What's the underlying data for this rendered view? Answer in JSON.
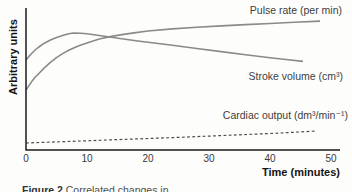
{
  "figure": {
    "caption_label": "Figure 2",
    "caption_text": "Correlated changes in …"
  },
  "chart_data": {
    "type": "line",
    "title": "",
    "xlabel": "Time (minutes)",
    "ylabel": "Arbitrary units",
    "xlim": [
      0,
      51.5
    ],
    "ylim": [
      0,
      100
    ],
    "x_ticks": [
      0,
      10,
      20,
      30,
      40,
      50
    ],
    "grid": false,
    "legend_position": "inline-labels-right",
    "axis_color": "#1a1a1a",
    "series": [
      {
        "id": "pulse-rate",
        "name": "Pulse rate (per min)",
        "style": "solid",
        "color": "#8a8a8a",
        "stroke_width": 1.6,
        "points": [
          [
            0,
            42.3
          ],
          [
            0.5,
            45.5
          ],
          [
            1,
            48.5
          ],
          [
            1.5,
            51.2
          ],
          [
            2,
            53.4
          ],
          [
            3,
            57.8
          ],
          [
            4,
            61.7
          ],
          [
            5,
            65.0
          ],
          [
            6,
            67.9
          ],
          [
            7,
            70.2
          ],
          [
            8,
            72.2
          ],
          [
            9,
            73.9
          ],
          [
            10,
            75.4
          ],
          [
            12,
            78.2
          ],
          [
            14,
            80.0
          ],
          [
            16,
            81.4
          ],
          [
            18,
            82.7
          ],
          [
            20,
            83.8
          ],
          [
            24,
            85.3
          ],
          [
            28,
            86.4
          ],
          [
            32,
            87.4
          ],
          [
            36,
            88.3
          ],
          [
            40,
            89.1
          ],
          [
            44,
            90.0
          ],
          [
            48.2,
            90.8
          ]
        ]
      },
      {
        "id": "stroke-volume",
        "name": "Stroke volume (cm³)",
        "style": "solid",
        "color": "#8a8a8a",
        "stroke_width": 1.6,
        "points": [
          [
            0,
            63.4
          ],
          [
            0.5,
            66.0
          ],
          [
            1,
            68.3
          ],
          [
            1.5,
            70.4
          ],
          [
            2,
            72.2
          ],
          [
            3,
            75.2
          ],
          [
            4,
            77.5
          ],
          [
            5,
            79.3
          ],
          [
            6,
            80.7
          ],
          [
            7,
            81.9
          ],
          [
            7.8,
            82.4
          ],
          [
            9,
            82.2
          ],
          [
            10,
            81.9
          ],
          [
            12,
            80.6
          ],
          [
            14,
            79.4
          ],
          [
            16,
            78.2
          ],
          [
            18,
            77.0
          ],
          [
            20,
            75.9
          ],
          [
            24,
            73.7
          ],
          [
            28,
            71.5
          ],
          [
            32,
            69.3
          ],
          [
            36,
            67.1
          ],
          [
            40,
            65.0
          ],
          [
            43,
            63.6
          ],
          [
            45.4,
            62.4
          ]
        ]
      },
      {
        "id": "cardiac-output",
        "name": "Cardiac output (dm³/min⁻¹)",
        "style": "dashed",
        "color": "#4d4d4d",
        "stroke_width": 1.2,
        "points": [
          [
            0,
            4.9
          ],
          [
            5,
            5.7
          ],
          [
            10,
            6.5
          ],
          [
            15,
            7.3
          ],
          [
            20,
            8.1
          ],
          [
            25,
            8.9
          ],
          [
            30,
            9.8
          ],
          [
            35,
            10.7
          ],
          [
            40,
            11.6
          ],
          [
            44,
            12.5
          ],
          [
            47.5,
            13.4
          ]
        ]
      }
    ]
  }
}
